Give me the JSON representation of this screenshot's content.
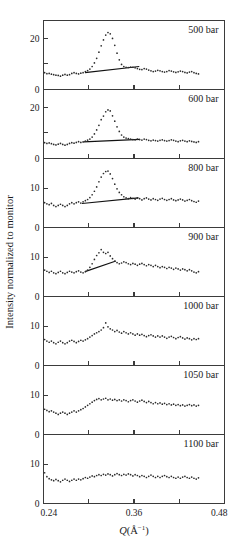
{
  "figure": {
    "ylabel": "Intensity normalized to monitor",
    "xlabel_symbol": "Q",
    "xlabel_units": "(Å",
    "xlabel_exp": "−1",
    "xlabel_close": ")",
    "xlabel_full": "Q(Å−1)"
  },
  "axis": {
    "x_ticks_major": [
      "0.24",
      "0.36",
      "0.48"
    ],
    "x_tick_values": [
      0.24,
      0.36,
      0.48
    ],
    "x_minor_values": [
      0.3,
      0.42
    ],
    "xlim": [
      0.24,
      0.48
    ],
    "y_label_tall": [
      "20",
      "0"
    ],
    "y_label_short": [
      "10",
      "0"
    ]
  },
  "chart_data": {
    "type": "scatter",
    "title": "",
    "xlabel": "Q(Å−1)",
    "ylabel": "Intensity normalized to monitor",
    "xlim": [
      0.24,
      0.48
    ],
    "grid": false,
    "legend": "none",
    "panel_label_position": "top-right",
    "panels": [
      {
        "label": "500 bar",
        "ylim": [
          0,
          27
        ],
        "yticks": [
          0,
          10,
          20
        ],
        "yticklabels": [
          "0",
          "",
          "20"
        ],
        "peak_q": 0.317,
        "peak_value": 22.3,
        "baseline_line": {
          "x": [
            0.295,
            0.367
          ],
          "y": [
            6.6,
            9.0
          ]
        },
        "x": [
          0.2415,
          0.2445,
          0.2475,
          0.2505,
          0.2535,
          0.2565,
          0.2595,
          0.2625,
          0.2655,
          0.2685,
          0.2715,
          0.2745,
          0.2775,
          0.2805,
          0.2835,
          0.2865,
          0.2895,
          0.2925,
          0.2955,
          0.2985,
          0.3015,
          0.3045,
          0.3075,
          0.3105,
          0.3135,
          0.3165,
          0.3195,
          0.3225,
          0.3255,
          0.3285,
          0.3315,
          0.3345,
          0.3375,
          0.3405,
          0.3435,
          0.3465,
          0.3495,
          0.3525,
          0.3555,
          0.3585,
          0.3615,
          0.3645,
          0.3675,
          0.3705,
          0.3735,
          0.3765,
          0.3795,
          0.3825,
          0.3855,
          0.3885,
          0.3915,
          0.3945,
          0.3975,
          0.4005,
          0.4035,
          0.4065,
          0.4095,
          0.4125,
          0.4155,
          0.4185,
          0.4215,
          0.4245,
          0.4275,
          0.4305,
          0.4335,
          0.4365,
          0.4395,
          0.4425,
          0.4455
        ],
        "y": [
          6.6,
          6.2,
          6.3,
          6.0,
          5.8,
          5.6,
          5.5,
          5.2,
          5.6,
          5.9,
          5.6,
          5.8,
          6.3,
          6.6,
          6.3,
          6.1,
          6.4,
          6.6,
          7.0,
          7.4,
          8.0,
          9.0,
          10.4,
          12.2,
          14.6,
          17.1,
          19.4,
          21.3,
          22.3,
          21.8,
          20.0,
          17.3,
          14.2,
          11.6,
          9.8,
          9.0,
          8.7,
          8.6,
          8.8,
          8.7,
          8.5,
          8.2,
          7.9,
          7.8,
          8.2,
          8.0,
          7.6,
          7.3,
          7.0,
          7.2,
          7.5,
          7.3,
          7.0,
          6.8,
          7.0,
          7.4,
          7.2,
          6.9,
          6.7,
          6.9,
          7.2,
          7.0,
          6.7,
          6.5,
          6.8,
          7.0,
          6.6,
          6.3,
          6.1
        ]
      },
      {
        "label": "600 bar",
        "ylim": [
          0,
          27
        ],
        "yticks": [
          0,
          10,
          20
        ],
        "yticklabels": [
          "0",
          "",
          "20"
        ],
        "peak_q": 0.317,
        "peak_value": 19.0,
        "baseline_line": {
          "x": [
            0.293,
            0.368
          ],
          "y": [
            6.5,
            7.5
          ]
        },
        "x": [
          0.2415,
          0.2445,
          0.2475,
          0.2505,
          0.2535,
          0.2565,
          0.2595,
          0.2625,
          0.2655,
          0.2685,
          0.2715,
          0.2745,
          0.2775,
          0.2805,
          0.2835,
          0.2865,
          0.2895,
          0.2925,
          0.2955,
          0.2985,
          0.3015,
          0.3045,
          0.3075,
          0.3105,
          0.3135,
          0.3165,
          0.3195,
          0.3225,
          0.3255,
          0.3285,
          0.3315,
          0.3345,
          0.3375,
          0.3405,
          0.3435,
          0.3465,
          0.3495,
          0.3525,
          0.3555,
          0.3585,
          0.3615,
          0.3645,
          0.3675,
          0.3705,
          0.3735,
          0.3765,
          0.3795,
          0.3825,
          0.3855,
          0.3885,
          0.3915,
          0.3945,
          0.3975,
          0.4005,
          0.4035,
          0.4065,
          0.4095,
          0.4125,
          0.4155,
          0.4185,
          0.4215,
          0.4245,
          0.4275,
          0.4305,
          0.4335,
          0.4365,
          0.4395,
          0.4425,
          0.4455
        ],
        "y": [
          6.2,
          5.9,
          6.1,
          5.8,
          5.5,
          5.3,
          5.6,
          5.9,
          5.5,
          5.2,
          5.5,
          5.9,
          6.2,
          6.0,
          6.3,
          6.6,
          6.3,
          6.5,
          6.8,
          7.2,
          7.6,
          8.4,
          9.6,
          11.2,
          13.0,
          15.2,
          16.6,
          18.3,
          19.0,
          18.6,
          16.7,
          14.6,
          12.4,
          10.6,
          9.2,
          8.4,
          8.0,
          7.8,
          7.6,
          7.4,
          7.3,
          7.6,
          7.4,
          7.2,
          7.6,
          7.4,
          7.1,
          6.9,
          7.2,
          7.0,
          6.8,
          7.1,
          7.3,
          7.0,
          6.8,
          7.0,
          7.3,
          7.1,
          6.8,
          6.6,
          6.9,
          7.1,
          6.8,
          6.6,
          6.9,
          6.7,
          6.5,
          6.3,
          6.6
        ]
      },
      {
        "label": "800 bar",
        "ylim": [
          0,
          17.5
        ],
        "yticks": [
          0,
          10
        ],
        "yticklabels": [
          "0",
          "10"
        ],
        "peak_q": 0.317,
        "peak_value": 14.3,
        "baseline_line": {
          "x": [
            0.291,
            0.366
          ],
          "y": [
            6.1,
            7.5
          ]
        },
        "x": [
          0.2415,
          0.2445,
          0.2475,
          0.2505,
          0.2535,
          0.2565,
          0.2595,
          0.2625,
          0.2655,
          0.2685,
          0.2715,
          0.2745,
          0.2775,
          0.2805,
          0.2835,
          0.2865,
          0.2895,
          0.2925,
          0.2955,
          0.2985,
          0.3015,
          0.3045,
          0.3075,
          0.3105,
          0.3135,
          0.3165,
          0.3195,
          0.3225,
          0.3255,
          0.3285,
          0.3315,
          0.3345,
          0.3375,
          0.3405,
          0.3435,
          0.3465,
          0.3495,
          0.3525,
          0.3555,
          0.3585,
          0.3615,
          0.3645,
          0.3675,
          0.3705,
          0.3735,
          0.3765,
          0.3795,
          0.3825,
          0.3855,
          0.3885,
          0.3915,
          0.3945,
          0.3975,
          0.4005,
          0.4035,
          0.4065,
          0.4095,
          0.4125,
          0.4155,
          0.4185,
          0.4215,
          0.4245,
          0.4275,
          0.4305,
          0.4335,
          0.4365,
          0.4395,
          0.4425,
          0.4455
        ],
        "y": [
          6.3,
          6.0,
          5.8,
          6.1,
          5.6,
          5.3,
          5.6,
          5.9,
          5.6,
          5.3,
          5.6,
          6.0,
          6.3,
          6.0,
          6.3,
          6.5,
          6.2,
          6.5,
          6.8,
          7.1,
          7.6,
          8.3,
          9.2,
          10.3,
          11.6,
          12.8,
          13.7,
          14.2,
          14.3,
          13.6,
          12.4,
          11.0,
          9.8,
          8.9,
          8.3,
          7.8,
          7.5,
          7.3,
          7.6,
          7.4,
          7.2,
          7.5,
          7.3,
          7.0,
          7.3,
          7.5,
          7.2,
          7.0,
          7.3,
          7.1,
          6.9,
          7.2,
          7.4,
          7.1,
          6.9,
          7.1,
          7.3,
          7.0,
          6.8,
          7.0,
          7.2,
          7.0,
          6.7,
          6.9,
          7.1,
          6.8,
          6.6,
          6.4,
          6.7
        ]
      },
      {
        "label": "900 bar",
        "ylim": [
          0,
          17.5
        ],
        "yticks": [
          0,
          10
        ],
        "yticklabels": [
          "0",
          "10"
        ],
        "peak_q": 0.313,
        "peak_value": 11.9,
        "baseline_line": {
          "x": [
            0.295,
            0.336
          ],
          "y": [
            6.3,
            9.0
          ]
        },
        "x": [
          0.2415,
          0.2445,
          0.2475,
          0.2505,
          0.2535,
          0.2565,
          0.2595,
          0.2625,
          0.2655,
          0.2685,
          0.2715,
          0.2745,
          0.2775,
          0.2805,
          0.2835,
          0.2865,
          0.2895,
          0.2925,
          0.2955,
          0.2985,
          0.3015,
          0.3045,
          0.3075,
          0.3105,
          0.3135,
          0.3165,
          0.3195,
          0.3225,
          0.3255,
          0.3285,
          0.3315,
          0.3345,
          0.3375,
          0.3405,
          0.3435,
          0.3465,
          0.3495,
          0.3525,
          0.3555,
          0.3585,
          0.3615,
          0.3645,
          0.3675,
          0.3705,
          0.3735,
          0.3765,
          0.3795,
          0.3825,
          0.3855,
          0.3885,
          0.3915,
          0.3945,
          0.3975,
          0.4005,
          0.4035,
          0.4065,
          0.4095,
          0.4125,
          0.4155,
          0.4185,
          0.4215,
          0.4245,
          0.4275,
          0.4305,
          0.4335,
          0.4365,
          0.4395,
          0.4425,
          0.4455
        ],
        "y": [
          6.7,
          6.4,
          6.1,
          6.4,
          6.0,
          5.8,
          6.1,
          6.4,
          6.0,
          5.8,
          6.1,
          6.4,
          6.2,
          6.0,
          6.3,
          6.5,
          6.2,
          6.0,
          6.3,
          6.7,
          7.4,
          8.3,
          9.4,
          10.4,
          11.1,
          11.9,
          11.2,
          10.9,
          11.2,
          10.3,
          9.6,
          9.0,
          8.6,
          8.3,
          8.5,
          8.8,
          8.6,
          8.3,
          8.1,
          8.4,
          8.2,
          7.9,
          8.2,
          8.4,
          8.1,
          7.8,
          8.1,
          7.9,
          7.6,
          7.9,
          7.6,
          7.3,
          7.6,
          7.4,
          7.1,
          7.4,
          7.2,
          6.9,
          7.2,
          7.0,
          6.7,
          7.0,
          6.8,
          6.5,
          6.8,
          6.5,
          6.2,
          6.0,
          6.3
        ]
      },
      {
        "label": "1000 bar",
        "ylim": [
          0,
          17.5
        ],
        "yticks": [
          0,
          10
        ],
        "yticklabels": [
          "0",
          "10"
        ],
        "peak_q": 0.318,
        "peak_value": 10.8,
        "baseline_line": null,
        "x": [
          0.2415,
          0.2445,
          0.2475,
          0.2505,
          0.2535,
          0.2565,
          0.2595,
          0.2625,
          0.2655,
          0.2685,
          0.2715,
          0.2745,
          0.2775,
          0.2805,
          0.2835,
          0.2865,
          0.2895,
          0.2925,
          0.2955,
          0.2985,
          0.3015,
          0.3045,
          0.3075,
          0.3105,
          0.3135,
          0.3165,
          0.3195,
          0.3225,
          0.3255,
          0.3285,
          0.3315,
          0.3345,
          0.3375,
          0.3405,
          0.3435,
          0.3465,
          0.3495,
          0.3525,
          0.3555,
          0.3585,
          0.3615,
          0.3645,
          0.3675,
          0.3705,
          0.3735,
          0.3765,
          0.3795,
          0.3825,
          0.3855,
          0.3885,
          0.3915,
          0.3945,
          0.3975,
          0.4005,
          0.4035,
          0.4065,
          0.4095,
          0.4125,
          0.4155,
          0.4185,
          0.4215,
          0.4245,
          0.4275,
          0.4305,
          0.4335,
          0.4365,
          0.4395,
          0.4425,
          0.4455
        ],
        "y": [
          6.6,
          6.2,
          5.9,
          6.2,
          5.8,
          5.5,
          5.9,
          6.2,
          5.8,
          5.5,
          5.8,
          6.2,
          6.4,
          6.1,
          5.8,
          6.1,
          6.4,
          6.2,
          6.5,
          6.8,
          7.2,
          7.6,
          8.0,
          8.3,
          8.6,
          9.0,
          9.6,
          10.8,
          9.8,
          9.3,
          9.0,
          8.6,
          8.9,
          8.5,
          8.2,
          8.6,
          8.3,
          8.0,
          8.3,
          8.0,
          7.7,
          8.0,
          7.7,
          7.9,
          7.6,
          7.3,
          7.6,
          7.8,
          7.5,
          7.2,
          7.5,
          7.2,
          7.5,
          7.2,
          6.9,
          7.2,
          7.4,
          7.1,
          6.8,
          7.1,
          7.3,
          7.0,
          6.7,
          7.0,
          6.8,
          6.5,
          6.8,
          6.6,
          6.8
        ]
      },
      {
        "label": "1050 bar",
        "ylim": [
          0,
          17.5
        ],
        "yticks": [
          0,
          10
        ],
        "yticklabels": [
          "0",
          "10"
        ],
        "peak_q": 0.335,
        "peak_value": 9.2,
        "baseline_line": null,
        "x": [
          0.2415,
          0.2445,
          0.2475,
          0.2505,
          0.2535,
          0.2565,
          0.2595,
          0.2625,
          0.2655,
          0.2685,
          0.2715,
          0.2745,
          0.2775,
          0.2805,
          0.2835,
          0.2865,
          0.2895,
          0.2925,
          0.2955,
          0.2985,
          0.3015,
          0.3045,
          0.3075,
          0.3105,
          0.3135,
          0.3165,
          0.3195,
          0.3225,
          0.3255,
          0.3285,
          0.3315,
          0.3345,
          0.3375,
          0.3405,
          0.3435,
          0.3465,
          0.3495,
          0.3525,
          0.3555,
          0.3585,
          0.3615,
          0.3645,
          0.3675,
          0.3705,
          0.3735,
          0.3765,
          0.3795,
          0.3825,
          0.3855,
          0.3885,
          0.3915,
          0.3945,
          0.3975,
          0.4005,
          0.4035,
          0.4065,
          0.4095,
          0.4125,
          0.4155,
          0.4185,
          0.4215,
          0.4245,
          0.4275,
          0.4305,
          0.4335,
          0.4365,
          0.4395,
          0.4425,
          0.4455
        ],
        "y": [
          6.4,
          6.1,
          5.8,
          6.0,
          5.7,
          5.4,
          5.1,
          5.4,
          5.7,
          5.4,
          5.1,
          5.4,
          5.7,
          6.0,
          5.7,
          6.0,
          6.3,
          6.6,
          7.0,
          7.4,
          7.8,
          8.2,
          8.6,
          8.9,
          9.1,
          8.8,
          9.0,
          9.2,
          8.8,
          9.0,
          8.7,
          8.9,
          8.6,
          8.8,
          8.5,
          8.8,
          8.6,
          8.3,
          8.6,
          8.8,
          8.5,
          8.2,
          8.5,
          8.7,
          8.4,
          8.1,
          8.4,
          8.1,
          7.8,
          8.1,
          7.8,
          8.0,
          7.7,
          7.9,
          7.6,
          7.8,
          7.5,
          7.7,
          7.4,
          7.6,
          7.3,
          7.5,
          7.2,
          7.4,
          7.6,
          7.3,
          7.5,
          7.2,
          7.4
        ]
      },
      {
        "label": "1100 bar",
        "ylim": [
          0,
          17.5
        ],
        "yticks": [
          0,
          10
        ],
        "yticklabels": [
          "0",
          "10"
        ],
        "peak_q": null,
        "peak_value": 7.6,
        "baseline_line": null,
        "x": [
          0.2415,
          0.2445,
          0.2475,
          0.2505,
          0.2535,
          0.2565,
          0.2595,
          0.2625,
          0.2655,
          0.2685,
          0.2715,
          0.2745,
          0.2775,
          0.2805,
          0.2835,
          0.2865,
          0.2895,
          0.2925,
          0.2955,
          0.2985,
          0.3015,
          0.3045,
          0.3075,
          0.3105,
          0.3135,
          0.3165,
          0.3195,
          0.3225,
          0.3255,
          0.3285,
          0.3315,
          0.3345,
          0.3375,
          0.3405,
          0.3435,
          0.3465,
          0.3495,
          0.3525,
          0.3555,
          0.3585,
          0.3615,
          0.3645,
          0.3675,
          0.3705,
          0.3735,
          0.3765,
          0.3795,
          0.3825,
          0.3855,
          0.3885,
          0.3915,
          0.3945,
          0.3975,
          0.4005,
          0.4035,
          0.4065,
          0.4095,
          0.4125,
          0.4155,
          0.4185,
          0.4215,
          0.4245,
          0.4275,
          0.4305,
          0.4335,
          0.4365,
          0.4395,
          0.4425,
          0.4455
        ],
        "y": [
          7.8,
          6.8,
          6.3,
          6.0,
          5.8,
          6.1,
          5.8,
          5.5,
          5.9,
          6.2,
          5.9,
          5.6,
          5.9,
          6.2,
          5.9,
          6.2,
          6.0,
          6.3,
          6.6,
          6.4,
          6.7,
          7.0,
          6.8,
          7.1,
          7.3,
          7.1,
          7.4,
          7.2,
          7.5,
          7.3,
          7.0,
          7.3,
          7.6,
          7.3,
          7.1,
          7.4,
          7.2,
          7.5,
          7.3,
          7.0,
          7.3,
          7.1,
          6.8,
          7.1,
          6.9,
          6.6,
          6.9,
          7.2,
          6.9,
          6.6,
          6.9,
          6.6,
          6.9,
          7.1,
          6.8,
          6.6,
          6.9,
          6.6,
          6.4,
          6.7,
          6.4,
          6.7,
          6.9,
          6.6,
          6.4,
          6.7,
          6.4,
          6.2,
          6.5
        ]
      }
    ]
  }
}
